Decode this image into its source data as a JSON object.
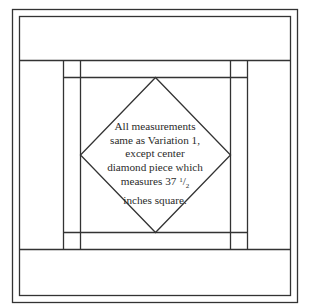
{
  "diagram": {
    "stroke_color": "#333333",
    "background": "#ffffff",
    "caption": {
      "lines": [
        "All measurements",
        "same as Variation 1,",
        "except center",
        "diamond piece which",
        "measures 37",
        "inches square."
      ],
      "fraction": {
        "numerator": "1",
        "separator": "/",
        "denominator": "2"
      }
    },
    "regions": {
      "outer_border": "outer-border",
      "inner_border": "inner-border",
      "top_band": "top-band",
      "bottom_band": "bottom-band",
      "left_strip": "left-sashing-strip",
      "right_strip": "right-sashing-strip",
      "center_square": "center-square",
      "center_diamond": "center-diamond"
    }
  }
}
